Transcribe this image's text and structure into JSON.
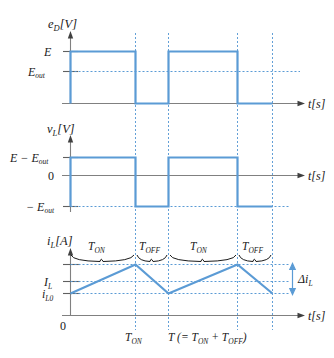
{
  "figure": {
    "colors": {
      "waveform": "#5B9BD5",
      "grid": "#5B9BD5",
      "axis": "#808080",
      "brace": "#1a1a1a",
      "text": "#1a1a1a",
      "background": "#ffffff"
    }
  },
  "charts": [
    {
      "id": "diode-voltage",
      "type": "line",
      "ylabel": "e",
      "ylabel_sub": "D",
      "ylabel_unit": "[V]",
      "xlabel": "t",
      "xlabel_unit": "[s]",
      "ytick_labels": [
        "E",
        "E"
      ],
      "ytick_subs": [
        "",
        "out"
      ],
      "ylevels": [
        "E",
        "E_out",
        "0"
      ],
      "waveform_description": "Square wave alternating between E during T_ON and 0 during T_OFF",
      "values": [
        {
          "t": 0.0,
          "v": "E"
        },
        {
          "t": 0.6,
          "v": "E"
        },
        {
          "t": 0.6,
          "v": "0"
        },
        {
          "t": 1.0,
          "v": "0"
        },
        {
          "t": 1.0,
          "v": "E"
        },
        {
          "t": 1.6,
          "v": "E"
        },
        {
          "t": 1.6,
          "v": "0"
        },
        {
          "t": 2.0,
          "v": "0"
        }
      ]
    },
    {
      "id": "inductor-voltage",
      "type": "line",
      "ylabel": "v",
      "ylabel_sub": "L",
      "ylabel_unit": "[V]",
      "xlabel": "t",
      "xlabel_unit": "[s]",
      "ytick_labels": [
        "E − E",
        "0",
        "− E"
      ],
      "ytick_subs": [
        "out",
        "",
        "out"
      ],
      "waveform_description": "Square wave alternating between E-E_out during T_ON and -E_out during T_OFF",
      "values": [
        {
          "t": 0.0,
          "v": "E-Eout"
        },
        {
          "t": 0.6,
          "v": "E-Eout"
        },
        {
          "t": 0.6,
          "v": "-Eout"
        },
        {
          "t": 1.0,
          "v": "-Eout"
        },
        {
          "t": 1.0,
          "v": "E-Eout"
        },
        {
          "t": 1.6,
          "v": "E-Eout"
        },
        {
          "t": 1.6,
          "v": "-Eout"
        },
        {
          "t": 2.0,
          "v": "-Eout"
        }
      ]
    },
    {
      "id": "inductor-current",
      "type": "line",
      "ylabel": "i",
      "ylabel_sub": "L",
      "ylabel_unit": "[A]",
      "xlabel": "t",
      "xlabel_unit": "[s]",
      "ytick_labels": [
        "I",
        "i",
        "0"
      ],
      "ytick_subs": [
        "L",
        "L0",
        ""
      ],
      "ripple_label": "Δi",
      "ripple_sub": "L",
      "origin_label": "0",
      "waveform_description": "Triangular ripple current rising during T_ON and falling during T_OFF, mean value I_L",
      "values": [
        {
          "t": 0.0,
          "i": "i_L0"
        },
        {
          "t": 0.6,
          "i": "i_L0 + Δi_L"
        },
        {
          "t": 1.0,
          "i": "i_L0"
        },
        {
          "t": 1.6,
          "i": "i_L0 + Δi_L"
        },
        {
          "t": 2.0,
          "i": "i_L0"
        }
      ],
      "braces": [
        {
          "label": "T",
          "sub": "ON"
        },
        {
          "label": "T",
          "sub": "OFF"
        },
        {
          "label": "T",
          "sub": "ON"
        },
        {
          "label": "T",
          "sub": "OFF"
        }
      ],
      "xtick_labels": [
        {
          "main": "T",
          "sub": "ON"
        },
        {
          "main": "T (= T",
          "sub": "ON",
          "main2": " + T",
          "sub2": "OFF",
          "main3": ")"
        }
      ]
    }
  ]
}
